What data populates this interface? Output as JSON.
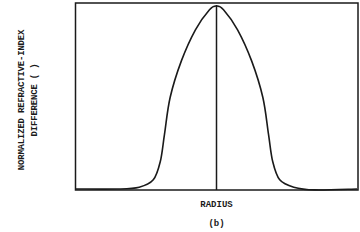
{
  "chart_data": {
    "type": "line",
    "title": "",
    "caption": "(b)",
    "xlabel": "RADIUS",
    "ylabel_line1": "NORMALIZED REFRACTIVE-INDEX",
    "ylabel_line2": "DIFFERENCE ( )",
    "grid": false,
    "legend": null,
    "x_ticks": [],
    "y_ticks": [],
    "center_line": true,
    "series": [
      {
        "name": "index profile",
        "x": [
          -1.0,
          -0.7,
          -0.55,
          -0.45,
          -0.4,
          -0.37,
          -0.33,
          -0.25,
          -0.15,
          -0.05,
          0.0,
          0.05,
          0.15,
          0.25,
          0.33,
          0.37,
          0.4,
          0.45,
          0.55,
          0.7,
          1.0
        ],
        "values": [
          0.0,
          0.0,
          0.01,
          0.05,
          0.15,
          0.3,
          0.5,
          0.7,
          0.87,
          0.98,
          1.0,
          0.98,
          0.87,
          0.7,
          0.5,
          0.3,
          0.15,
          0.05,
          0.01,
          -0.005,
          0.0
        ]
      }
    ],
    "xlim": [
      -1,
      1
    ],
    "ylim": [
      0,
      1
    ]
  }
}
